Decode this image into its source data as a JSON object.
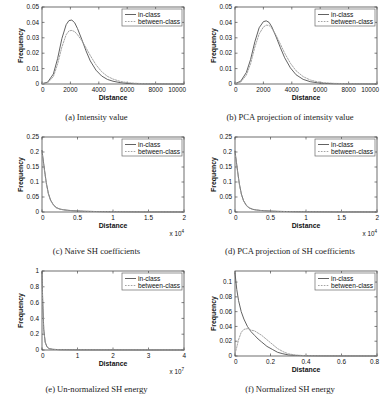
{
  "figure": {
    "background": "#ffffff",
    "line_color_in_class": "#5a5a5a",
    "line_color_between_class": "#9a9a9a",
    "legend": {
      "in_class": "in-class",
      "between_class": "between-class"
    }
  },
  "chart_data": [
    {
      "id": "a",
      "type": "line",
      "caption_label": "(a)",
      "caption_text": "Intensity value",
      "title": "",
      "xlabel": "Distance",
      "ylabel": "Frequency",
      "xlim": [
        0,
        10000
      ],
      "ylim": [
        0,
        0.05
      ],
      "xticks": [
        0,
        2000,
        4000,
        6000,
        8000,
        10000
      ],
      "xticklabels": [
        "0",
        "2000",
        "4000",
        "6000",
        "8000",
        "10000"
      ],
      "yticks": [
        0,
        0.01,
        0.02,
        0.03,
        0.04,
        0.05
      ],
      "yticklabels": [
        "0",
        "0.01",
        "0.02",
        "0.03",
        "0.04",
        "0.05"
      ],
      "x_exponent": "",
      "grid": false,
      "legend_position": "upper right",
      "legend": [
        "in-class",
        "between-class"
      ],
      "x": [
        0,
        400,
        800,
        1100,
        1400,
        1700,
        1900,
        2100,
        2300,
        2500,
        2800,
        3100,
        3400,
        3800,
        4200,
        4600,
        5000,
        5500,
        6000,
        6500,
        7000,
        8000,
        9000,
        10000
      ],
      "series": [
        {
          "name": "in-class",
          "values": [
            0.0002,
            0.0012,
            0.0065,
            0.0165,
            0.0295,
            0.0385,
            0.0412,
            0.0415,
            0.0398,
            0.036,
            0.029,
            0.0215,
            0.015,
            0.009,
            0.0052,
            0.003,
            0.0018,
            0.0009,
            0.0004,
            0.0002,
            0.0001,
            5e-05,
            2e-05,
            0.0
          ]
        },
        {
          "name": "between-class",
          "values": [
            0.0001,
            0.0008,
            0.0048,
            0.013,
            0.024,
            0.032,
            0.0345,
            0.0348,
            0.034,
            0.032,
            0.0282,
            0.0235,
            0.0185,
            0.0125,
            0.008,
            0.005,
            0.0032,
            0.0017,
            0.0009,
            0.0005,
            0.0003,
            0.0001,
            5e-05,
            0.0
          ]
        }
      ]
    },
    {
      "id": "b",
      "type": "line",
      "caption_label": "(b)",
      "caption_text": "PCA projection of intensity value",
      "title": "",
      "xlabel": "Distance",
      "ylabel": "Frequency",
      "xlim": [
        0,
        10000
      ],
      "ylim": [
        0,
        0.05
      ],
      "xticks": [
        0,
        2000,
        4000,
        6000,
        8000,
        10000
      ],
      "xticklabels": [
        "0",
        "2000",
        "4000",
        "6000",
        "8000",
        "10000"
      ],
      "yticks": [
        0,
        0.01,
        0.02,
        0.03,
        0.04,
        0.05
      ],
      "yticklabels": [
        "0",
        "0.01",
        "0.02",
        "0.03",
        "0.04",
        "0.05"
      ],
      "x_exponent": "",
      "grid": false,
      "legend_position": "upper right",
      "legend": [
        "in-class",
        "between-class"
      ],
      "x": [
        0,
        400,
        800,
        1100,
        1400,
        1700,
        2000,
        2200,
        2400,
        2600,
        2900,
        3200,
        3500,
        3900,
        4300,
        4800,
        5300,
        5800,
        6300,
        7000,
        8000,
        9000,
        10000
      ],
      "series": [
        {
          "name": "in-class",
          "values": [
            0.0002,
            0.0018,
            0.0075,
            0.016,
            0.0275,
            0.0365,
            0.0405,
            0.041,
            0.04,
            0.037,
            0.0305,
            0.0235,
            0.017,
            0.0105,
            0.006,
            0.003,
            0.0015,
            0.0008,
            0.0004,
            0.0002,
            0.0001,
            5e-05,
            0.0
          ]
        },
        {
          "name": "between-class",
          "values": [
            0.0001,
            0.0012,
            0.0058,
            0.0132,
            0.024,
            0.0325,
            0.037,
            0.0382,
            0.038,
            0.0362,
            0.0315,
            0.0258,
            0.02,
            0.0135,
            0.0086,
            0.0048,
            0.0026,
            0.0014,
            0.0008,
            0.0004,
            0.0002,
            0.0001,
            0.0
          ]
        }
      ]
    },
    {
      "id": "c",
      "type": "line",
      "caption_label": "(c)",
      "caption_text": "Naive SH coefficients",
      "title": "",
      "xlabel": "Distance",
      "ylabel": "Frequency",
      "xlim": [
        0,
        20000
      ],
      "ylim": [
        0,
        0.25
      ],
      "xticks": [
        0,
        5000,
        10000,
        15000,
        20000
      ],
      "xticklabels": [
        "0",
        "0.5",
        "1",
        "1.5",
        "2"
      ],
      "yticks": [
        0,
        0.05,
        0.1,
        0.15,
        0.2,
        0.25
      ],
      "yticklabels": [
        "0",
        "0.05",
        "0.1",
        "0.15",
        "0.2",
        "0.25"
      ],
      "x_exponent": "x 10",
      "x_exponent_sup": "4",
      "grid": false,
      "legend_position": "upper right",
      "legend": [
        "in-class",
        "between-class"
      ],
      "x": [
        0,
        300,
        600,
        900,
        1200,
        1600,
        2000,
        2500,
        3000,
        3600,
        4200,
        5000,
        6000,
        8000,
        10000,
        14000,
        20000
      ],
      "series": [
        {
          "name": "in-class",
          "values": [
            0.205,
            0.15,
            0.098,
            0.062,
            0.04,
            0.024,
            0.015,
            0.01,
            0.0075,
            0.0058,
            0.0045,
            0.0035,
            0.0025,
            0.0014,
            0.0008,
            0.0003,
            0.0001
          ]
        },
        {
          "name": "between-class",
          "values": [
            0.2,
            0.146,
            0.095,
            0.06,
            0.039,
            0.023,
            0.014,
            0.0095,
            0.0072,
            0.0056,
            0.0044,
            0.0034,
            0.0024,
            0.0013,
            0.0008,
            0.0003,
            0.0001
          ]
        }
      ]
    },
    {
      "id": "d",
      "type": "line",
      "caption_label": "(d)",
      "caption_text": "PCA projection of SH coefficients",
      "title": "",
      "xlabel": "Distance",
      "ylabel": "Frequency",
      "xlim": [
        0,
        20000
      ],
      "ylim": [
        0,
        0.25
      ],
      "xticks": [
        0,
        5000,
        10000,
        15000,
        20000
      ],
      "xticklabels": [
        "0",
        "0.5",
        "1",
        "1.5",
        "2"
      ],
      "yticks": [
        0,
        0.05,
        0.1,
        0.15,
        0.2,
        0.25
      ],
      "yticklabels": [
        "0",
        "0.05",
        "0.1",
        "0.15",
        "0.2",
        "0.25"
      ],
      "x_exponent": "x 10",
      "x_exponent_sup": "4",
      "grid": false,
      "legend_position": "upper right",
      "legend": [
        "in-class",
        "between-class"
      ],
      "x": [
        0,
        300,
        600,
        900,
        1200,
        1600,
        2000,
        2500,
        3000,
        3600,
        4200,
        5000,
        6000,
        8000,
        10000,
        14000,
        20000
      ],
      "series": [
        {
          "name": "in-class",
          "values": [
            0.203,
            0.148,
            0.096,
            0.06,
            0.038,
            0.022,
            0.014,
            0.009,
            0.0068,
            0.0052,
            0.0042,
            0.0032,
            0.0022,
            0.0012,
            0.0007,
            0.0003,
            0.0001
          ]
        },
        {
          "name": "between-class",
          "values": [
            0.198,
            0.144,
            0.093,
            0.058,
            0.037,
            0.021,
            0.013,
            0.0086,
            0.0065,
            0.005,
            0.004,
            0.0031,
            0.0021,
            0.0011,
            0.0007,
            0.0002,
            0.0001
          ]
        }
      ]
    },
    {
      "id": "e",
      "type": "line",
      "caption_label": "(e)",
      "caption_text": "Un-normalized SH energy",
      "title": "",
      "xlabel": "Distance",
      "ylabel": "Frequency",
      "xlim": [
        0,
        40000000
      ],
      "ylim": [
        0,
        1
      ],
      "xticks": [
        0,
        10000000,
        20000000,
        30000000,
        40000000
      ],
      "xticklabels": [
        "0",
        "1",
        "2",
        "3",
        "4"
      ],
      "yticks": [
        0,
        0.2,
        0.4,
        0.6,
        0.8,
        1
      ],
      "yticklabels": [
        "0",
        "0.2",
        "0.4",
        "0.6",
        "0.8",
        "1"
      ],
      "x_exponent": "x 10",
      "x_exponent_sup": "7",
      "grid": false,
      "legend_position": "upper right",
      "legend": [
        "in-class",
        "between-class"
      ],
      "x": [
        0,
        200000,
        500000,
        900000,
        1400000,
        2000000,
        3000000,
        5000000,
        10000000,
        20000000,
        30000000,
        40000000
      ],
      "series": [
        {
          "name": "in-class",
          "values": [
            0.98,
            0.62,
            0.26,
            0.1,
            0.04,
            0.018,
            0.009,
            0.004,
            0.002,
            0.001,
            0.0005,
            0.0002
          ]
        },
        {
          "name": "between-class",
          "values": [
            0.96,
            0.6,
            0.25,
            0.095,
            0.038,
            0.017,
            0.0085,
            0.0038,
            0.0019,
            0.001,
            0.0005,
            0.0002
          ]
        }
      ]
    },
    {
      "id": "f",
      "type": "line",
      "caption_label": "(f)",
      "caption_text": "Normalized SH energy",
      "title": "",
      "xlabel": "Distance",
      "ylabel": "Frequency",
      "xlim": [
        0,
        0.8
      ],
      "ylim": [
        0,
        0.115
      ],
      "xticks": [
        0,
        0.2,
        0.4,
        0.6,
        0.8
      ],
      "xticklabels": [
        "0",
        "0.2",
        "0.4",
        "0.6",
        "0.8"
      ],
      "yticks": [
        0,
        0.02,
        0.04,
        0.06,
        0.08,
        0.1
      ],
      "yticklabels": [
        "0",
        "0.02",
        "0.04",
        "0.06",
        "0.08",
        "0.1"
      ],
      "x_exponent": "",
      "grid": false,
      "legend_position": "upper right",
      "legend": [
        "in-class",
        "between-class"
      ],
      "x": [
        0,
        0.01,
        0.02,
        0.035,
        0.05,
        0.07,
        0.09,
        0.11,
        0.13,
        0.15,
        0.18,
        0.21,
        0.24,
        0.27,
        0.3,
        0.34,
        0.4,
        0.5,
        0.65,
        0.8
      ],
      "series": [
        {
          "name": "in-class",
          "values": [
            0.112,
            0.09,
            0.075,
            0.06,
            0.05,
            0.04,
            0.033,
            0.028,
            0.023,
            0.019,
            0.013,
            0.009,
            0.005,
            0.003,
            0.0015,
            0.0008,
            0.0003,
            0.0001,
            5e-05,
            0.0
          ]
        },
        {
          "name": "between-class",
          "values": [
            0.003,
            0.012,
            0.022,
            0.032,
            0.036,
            0.037,
            0.035,
            0.034,
            0.031,
            0.028,
            0.022,
            0.016,
            0.01,
            0.006,
            0.003,
            0.0013,
            0.0004,
            0.0001,
            5e-05,
            0.0
          ]
        }
      ]
    }
  ]
}
